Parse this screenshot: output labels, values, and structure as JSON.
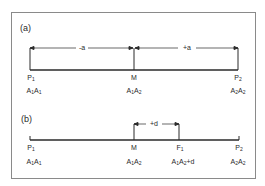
{
  "panel_a": {
    "label": "(a)",
    "segments": [
      {
        "label": "-a"
      },
      {
        "label": "+a"
      }
    ],
    "points": [
      {
        "name": "P",
        "sub": "1",
        "genotype": [
          [
            "A",
            "1"
          ],
          [
            "A",
            "1"
          ]
        ]
      },
      {
        "name": "M",
        "sub": "",
        "genotype": [
          [
            "A",
            "1"
          ],
          [
            "A",
            "2"
          ]
        ]
      },
      {
        "name": "P",
        "sub": "2",
        "genotype": [
          [
            "A",
            "2"
          ],
          [
            "A",
            "2"
          ]
        ]
      }
    ]
  },
  "panel_b": {
    "label": "(b)",
    "segments": [
      {
        "label": "+d"
      }
    ],
    "points": [
      {
        "name": "P",
        "sub": "1",
        "genotype": [
          [
            "A",
            "1"
          ],
          [
            "A",
            "1"
          ]
        ],
        "suffix": ""
      },
      {
        "name": "M",
        "sub": "",
        "genotype": [
          [
            "A",
            "1"
          ],
          [
            "A",
            "2"
          ]
        ],
        "suffix": ""
      },
      {
        "name": "F",
        "sub": "1",
        "genotype": [
          [
            "A",
            "1"
          ],
          [
            "A",
            "2"
          ]
        ],
        "suffix": "+d"
      },
      {
        "name": "P",
        "sub": "2",
        "genotype": [
          [
            "A",
            "2"
          ],
          [
            "A",
            "2"
          ]
        ],
        "suffix": ""
      }
    ]
  },
  "colors": {
    "line": "#2a2a2a",
    "frame": "#8a8a8a"
  }
}
